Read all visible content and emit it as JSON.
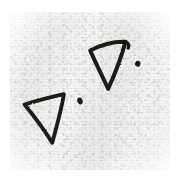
{
  "artwork": {
    "medium": "ink-on-paper-scan",
    "title": "Hand-drawn triangles and dots",
    "canvas": {
      "width": 180,
      "height": 185
    },
    "background_color": "#ffffff",
    "paper": {
      "name": "scanned-paper-texture",
      "base_color": "#f4f4f4",
      "grain_color": "#b0b0b0",
      "region": {
        "x": 10,
        "y": 12,
        "width": 160,
        "height": 158
      }
    },
    "ink_color": "#1a1a18",
    "stroke_width": 3.6,
    "shapes": [
      {
        "name": "triangle-lower-left",
        "type": "triangle",
        "stroke_width": 3.8,
        "path": "M 24.5 104.5 C 38 100.5 52 96.8 63.8 94.2 C 62.2 106.5 57.8 122.5 52.2 142.8 C 43.2 128.0 33.0 114.8 24.5 104.5 Z",
        "vertices": [
          {
            "label": "left",
            "x": 24.5,
            "y": 104.5
          },
          {
            "label": "right",
            "x": 63.8,
            "y": 94.2
          },
          {
            "label": "bottom",
            "x": 52.2,
            "y": 142.8
          }
        ]
      },
      {
        "name": "triangle-upper-right",
        "type": "triangle",
        "stroke_width": 4.0,
        "path": "M 90.2 50.5 C 100.0 45.5 112.0 41.2 125.5 41.8 C 122.0 55.0 115.8 72.0 108.2 88.8 C 101.5 74.8 94.8 61.0 90.2 50.5 Z",
        "vertices": [
          {
            "label": "left",
            "x": 90.2,
            "y": 50.5
          },
          {
            "label": "top-right",
            "x": 125.5,
            "y": 41.8
          },
          {
            "label": "bottom",
            "x": 108.2,
            "y": 88.8
          }
        ],
        "tail": {
          "name": "top-right-hook",
          "path": "M 125.5 41.8 C 128.5 43.2 129.5 45.5 128.2 48.0"
        }
      }
    ],
    "dots": [
      {
        "name": "ink-dot-center",
        "cx": 80.0,
        "cy": 101.0,
        "rx": 2.6,
        "ry": 3.4,
        "rotation": -22
      },
      {
        "name": "ink-dot-right",
        "cx": 137.8,
        "cy": 63.8,
        "rx": 2.7,
        "ry": 2.9,
        "rotation": 15
      }
    ]
  }
}
